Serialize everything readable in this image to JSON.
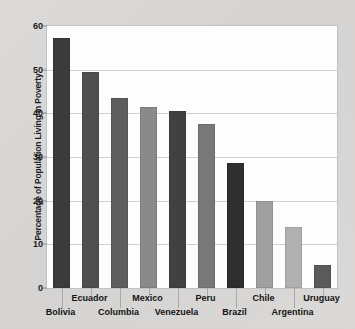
{
  "chart_data": {
    "type": "bar",
    "title": "",
    "subtitle": "",
    "xlabel": "",
    "ylabel": "Percentage of Population Living in Poverty",
    "categories": [
      "Bolivia",
      "Ecuador",
      "Columbia",
      "Mexico",
      "Venezuela",
      "Peru",
      "Brazil",
      "Chile",
      "Argentina",
      "Uruguay"
    ],
    "values": [
      57.2,
      49.5,
      43.5,
      41.5,
      40.5,
      37.5,
      28.7,
      20.0,
      14.0,
      5.2
    ],
    "bar_colors": [
      "#3b3b3b",
      "#4f4f4f",
      "#5e5e5e",
      "#8a8a8a",
      "#414141",
      "#787878",
      "#2f2f2f",
      "#a0a0a0",
      "#b0b0b0",
      "#5a5a5a"
    ],
    "ylim": [
      0,
      60
    ],
    "yticks": [
      0,
      10,
      20,
      30,
      40,
      50,
      60
    ],
    "ytick_labels": [
      "0",
      "10",
      "20",
      "30",
      "40",
      "50",
      "60"
    ],
    "gridlines": [
      10,
      20,
      30,
      40,
      50
    ],
    "grid": true,
    "legend": false,
    "legend_position": "none",
    "label_rows": [
      1,
      0,
      1,
      0,
      1,
      0,
      1,
      0,
      1,
      0
    ],
    "colors": {
      "plot_background": "#fdfdfd",
      "page_background": "#d9d9d7",
      "axis_border": "#c2c2c2",
      "gridline": "#cfcfcf",
      "text": "#1a1a1a"
    }
  }
}
